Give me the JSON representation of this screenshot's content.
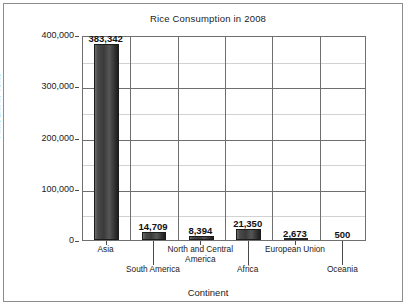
{
  "chart_data": {
    "type": "bar",
    "title": "Rice Consumption in 2008",
    "xlabel": "Continent",
    "ylabel": "Amount in Tons",
    "categories": [
      "Asia",
      "South America",
      "North and Central America",
      "Africa",
      "European Union",
      "Oceania"
    ],
    "values": [
      383342,
      14709,
      8394,
      21350,
      2673,
      500
    ],
    "value_labels": [
      "383,342",
      "14,709",
      "8,394",
      "21,350",
      "2,673",
      "500"
    ],
    "ylim": [
      0,
      400000
    ],
    "ytick_labels": [
      "400,000",
      "300,000",
      "200,000",
      "100,000",
      "0"
    ],
    "ytick_values": [
      400000,
      300000,
      200000,
      100000,
      0
    ],
    "minor_gridline_values": [
      350000,
      250000,
      150000,
      50000
    ],
    "grid": true,
    "legend": "none",
    "bar_color": "#3a3a3a",
    "gridline_color": "#6f6f6f",
    "minor_gridline_color": "#d2d2d2",
    "label_stagger": [
      "top",
      "bottom",
      "top",
      "bottom",
      "top",
      "bottom"
    ]
  }
}
